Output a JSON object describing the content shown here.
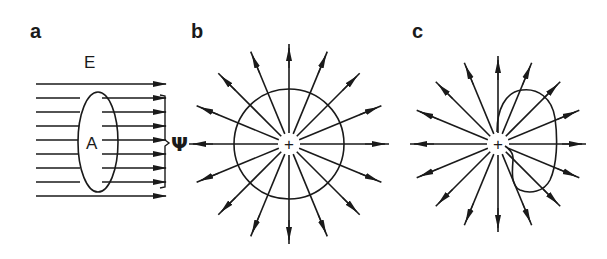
{
  "figure": {
    "colors": {
      "ink": "#1a1a1a",
      "background": "#ffffff"
    },
    "panels": [
      {
        "id": "a",
        "label": "a",
        "field_label": "E",
        "surface_label": "A",
        "flux_label": "Ψ",
        "field_line_count": 9,
        "field_line_direction": "left-to-right"
      },
      {
        "id": "b",
        "label": "b",
        "charge_label": "+",
        "radial_line_count": 16,
        "surface": "circle enclosing charge"
      },
      {
        "id": "c",
        "label": "c",
        "charge_label": "+",
        "radial_line_count": 16,
        "surface": "closed loop beside charge"
      }
    ]
  }
}
